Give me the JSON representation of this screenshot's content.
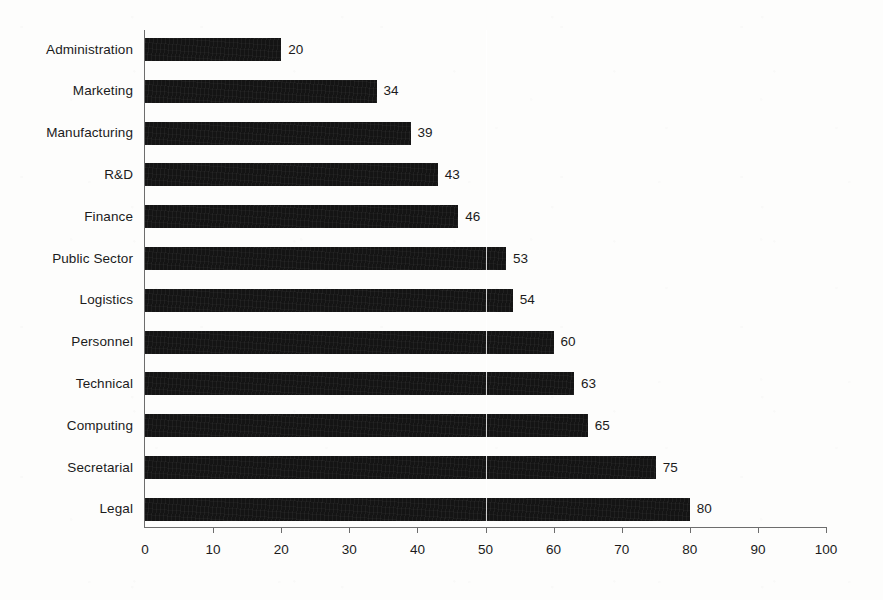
{
  "chart_data": {
    "type": "bar",
    "orientation": "horizontal",
    "title": "",
    "subtitle": "",
    "xlabel": "",
    "ylabel": "",
    "categories": [
      "Administration",
      "Marketing",
      "Manufacturing",
      "R&D",
      "Finance",
      "Public Sector",
      "Logistics",
      "Personnel",
      "Technical",
      "Computing",
      "Secretarial",
      "Legal"
    ],
    "values": [
      20,
      34,
      39,
      43,
      46,
      53,
      54,
      60,
      63,
      65,
      75,
      80
    ],
    "data_labels": [
      "20",
      "34",
      "39",
      "43",
      "46",
      "53",
      "54",
      "60",
      "63",
      "65",
      "75",
      "80"
    ],
    "xlim": [
      0,
      100
    ],
    "xticks": [
      0,
      10,
      20,
      30,
      40,
      50,
      60,
      70,
      80,
      90,
      100
    ],
    "xtick_labels": [
      "0",
      "10",
      "20",
      "30",
      "40",
      "50",
      "60",
      "70",
      "80",
      "90",
      "100"
    ],
    "grid": false,
    "gridlines_x": [
      50
    ],
    "legend": false,
    "legend_position": "none",
    "bar_color": "#141414",
    "axis_color": "#6d6d6d",
    "text_color": "#1b1b1b",
    "background_color": "#fdfdfc"
  }
}
